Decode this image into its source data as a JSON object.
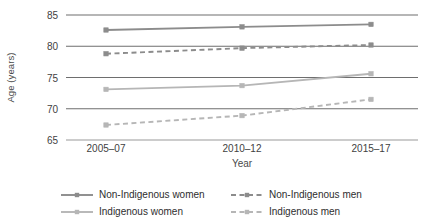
{
  "chart_data": {
    "type": "line",
    "title": "",
    "xlabel": "Year",
    "ylabel": "Age (years)",
    "categories": [
      "2005–07",
      "2010–12",
      "2015–17"
    ],
    "ylim": [
      65,
      85
    ],
    "yticks": [
      65,
      70,
      75,
      80,
      85
    ],
    "grid": true,
    "legend_position": "bottom",
    "series": [
      {
        "name": "Non-Indigenous women",
        "values": [
          82.6,
          83.1,
          83.5
        ],
        "style": "solid",
        "color": "#8c8c8c",
        "marker": "square"
      },
      {
        "name": "Non-Indigenous men",
        "values": [
          78.8,
          79.7,
          80.2
        ],
        "style": "dashed",
        "color": "#8c8c8c",
        "marker": "square"
      },
      {
        "name": "Indigenous women",
        "values": [
          73.1,
          73.7,
          75.6
        ],
        "style": "solid",
        "color": "#b6b6b6",
        "marker": "square"
      },
      {
        "name": "Indigenous men",
        "values": [
          67.4,
          68.9,
          71.5
        ],
        "style": "dashed",
        "color": "#b6b6b6",
        "marker": "square"
      }
    ]
  },
  "axes": {
    "ylabel": "Age (years)",
    "xlabel": "Year",
    "ytick_labels": [
      "85",
      "80",
      "75",
      "70",
      "65"
    ],
    "xtick_labels": [
      "2005–07",
      "2010–12",
      "2015–17"
    ]
  },
  "legend": {
    "items": [
      {
        "label": "Non-Indigenous women",
        "style": "solid",
        "color": "#8c8c8c"
      },
      {
        "label": "Non-Indigenous men",
        "style": "dashed",
        "color": "#8c8c8c"
      },
      {
        "label": "Indigenous women",
        "style": "solid",
        "color": "#b6b6b6"
      },
      {
        "label": "Indigenous men",
        "style": "dashed",
        "color": "#b6b6b6"
      }
    ]
  },
  "colors": {
    "gridline": "#6e6e6e",
    "baseline": "#9a9a9a",
    "text": "#3a3a3a",
    "background": "#ffffff"
  }
}
